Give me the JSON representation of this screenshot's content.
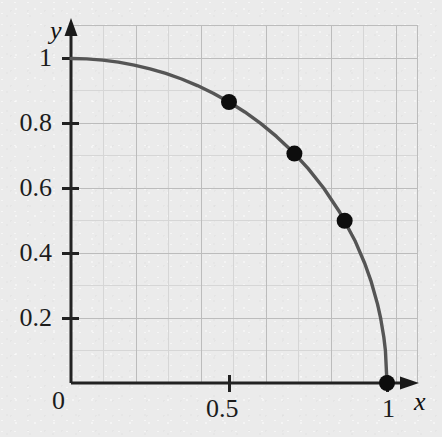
{
  "figure": {
    "background_color": "#ebebeb",
    "curve_color": "#555555",
    "point_color": "#0d0d0d",
    "axis_color": "#222222",
    "grid_major_color": "#b9b9b9",
    "grid_minor_color": "#d3d3d3"
  },
  "axes": {
    "x_name": "x",
    "y_name": "y"
  },
  "ticks": {
    "x": [
      {
        "label": "0",
        "value": 0
      },
      {
        "label": "0.5",
        "value": 0.5
      },
      {
        "label": "1",
        "value": 1
      }
    ],
    "y": [
      {
        "label": "0.2",
        "value": 0.2
      },
      {
        "label": "0.4",
        "value": 0.4
      },
      {
        "label": "0.6",
        "value": 0.6
      },
      {
        "label": "0.8",
        "value": 0.8
      },
      {
        "label": "1",
        "value": 1
      }
    ]
  },
  "chart_data": {
    "type": "line",
    "title": "",
    "subtitle": "",
    "xlabel": "x",
    "ylabel": "y",
    "xlim": [
      0,
      1.07
    ],
    "ylim": [
      0,
      1.11
    ],
    "grid": true,
    "grid_major_step": 0.2,
    "grid_minor_step": 0.1,
    "legend": null,
    "annotations": [],
    "series": [
      {
        "name": "quarter unit circle",
        "type": "line",
        "equation": "x^2 + y^2 = 1",
        "x": [
          0,
          0.05,
          0.1,
          0.15,
          0.2,
          0.25,
          0.3,
          0.35,
          0.4,
          0.45,
          0.5,
          0.55,
          0.6,
          0.65,
          0.7,
          0.75,
          0.8,
          0.85,
          0.9,
          0.93,
          0.95,
          0.97,
          0.98,
          0.99,
          0.995,
          1
        ],
        "y": [
          1,
          0.99875,
          0.99499,
          0.98869,
          0.9798,
          0.96825,
          0.95394,
          0.93675,
          0.91652,
          0.893,
          0.86603,
          0.83516,
          0.8,
          0.75993,
          0.71414,
          0.66144,
          0.6,
          0.52678,
          0.43589,
          0.36756,
          0.31225,
          0.2431,
          0.199,
          0.14107,
          0.09987,
          0
        ]
      },
      {
        "name": "marked points",
        "type": "scatter",
        "points": [
          {
            "x": 0.5,
            "y": 0.866
          },
          {
            "x": 0.707,
            "y": 0.707
          },
          {
            "x": 0.866,
            "y": 0.5
          },
          {
            "x": 1,
            "y": 0
          }
        ]
      }
    ]
  }
}
